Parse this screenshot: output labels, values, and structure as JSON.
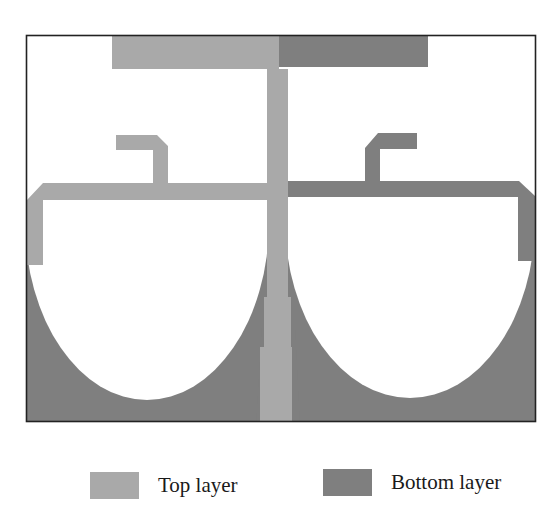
{
  "figure": {
    "colors": {
      "top_layer": "#a9a9a9",
      "bottom_layer": "#7f7f7f",
      "frame": "#222222",
      "background": "#ffffff"
    }
  },
  "legend": {
    "items": [
      {
        "label": "Top layer",
        "color": "#a9a9a9"
      },
      {
        "label": "Bottom layer",
        "color": "#7f7f7f"
      }
    ]
  }
}
